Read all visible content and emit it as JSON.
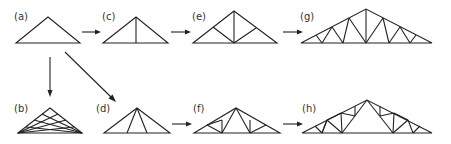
{
  "diagram": {
    "title": "",
    "line_color": "#222222",
    "label_color": "#333333",
    "panels": [
      {
        "id": "a",
        "label": "(a)",
        "description": "plain triangle"
      },
      {
        "id": "b",
        "label": "(b)",
        "description": "triangle with many crossing diagonals"
      },
      {
        "id": "c",
        "label": "(c)",
        "description": "triangle with central king post"
      },
      {
        "id": "d",
        "label": "(d)",
        "description": "triangle with two struts from apex"
      },
      {
        "id": "e",
        "label": "(e)",
        "description": "king post truss with two diagonals"
      },
      {
        "id": "f",
        "label": "(f)",
        "description": "fan truss with struts and webs"
      },
      {
        "id": "g",
        "label": "(g)",
        "description": "long-span truss with many webs"
      },
      {
        "id": "h",
        "label": "(h)",
        "description": "long-span fan truss with subdivided webs"
      }
    ],
    "arrows": [
      {
        "from": "a",
        "to": "c"
      },
      {
        "from": "c",
        "to": "e"
      },
      {
        "from": "e",
        "to": "g"
      },
      {
        "from": "a",
        "to": "b"
      },
      {
        "from": "a",
        "to": "d"
      },
      {
        "from": "d",
        "to": "f"
      },
      {
        "from": "f",
        "to": "h"
      }
    ]
  }
}
